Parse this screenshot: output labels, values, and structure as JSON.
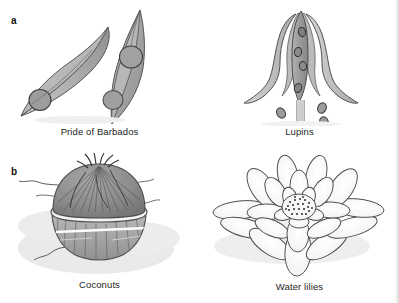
{
  "figure": {
    "panels": [
      {
        "label": "a",
        "items": [
          {
            "caption": "Pride of Barbados",
            "icon": "seed-pod-icon"
          },
          {
            "caption": "Lupins",
            "icon": "lupin-pod-icon"
          }
        ]
      },
      {
        "label": "b",
        "items": [
          {
            "caption": "Coconuts",
            "icon": "coconut-icon"
          },
          {
            "caption": "Water lilies",
            "icon": "water-lily-icon"
          }
        ]
      }
    ]
  },
  "colors": {
    "background": "#ffffff",
    "outline": "#4a4a4a",
    "pod_fill_light": "#c6c6c6",
    "pod_fill_mid": "#a9a9a9",
    "pod_fill_dark": "#8e8e8e",
    "seed_fill": "#9b9b9b",
    "coconut_husk": "#8a8a8a",
    "coconut_shell": "#a3a3a3",
    "shadow": "#e2e2e2",
    "text": "#232323"
  }
}
